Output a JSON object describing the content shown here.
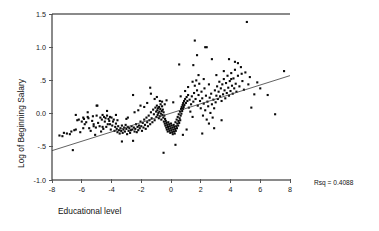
{
  "chart_data": {
    "type": "scatter",
    "title": "",
    "xlabel": "Educational level",
    "ylabel": "Log of Beginning Salary",
    "xlim": [
      -8,
      8
    ],
    "ylim": [
      -1.0,
      1.5
    ],
    "xticks": [
      -8,
      -6,
      -4,
      -2,
      0,
      2,
      4,
      6,
      8
    ],
    "xticklabels": [
      "-8",
      "-6",
      "-4",
      "-2",
      "0",
      "2",
      "4",
      "6",
      "8"
    ],
    "yticks": [
      -1.0,
      -0.5,
      0.0,
      0.5,
      1.0,
      1.5
    ],
    "yticklabels": [
      "-1.0",
      "-.5",
      "0.0",
      ".5",
      "1.0",
      "1.5"
    ],
    "grid": false,
    "legend": null,
    "annotations": [
      {
        "name": "rsq-annotation",
        "text": "Rsq = 0.4088",
        "x": 9.6,
        "y": -0.94
      }
    ],
    "fit_line": {
      "name": "regression-line",
      "x": [
        -8,
        8
      ],
      "y": [
        -0.558,
        0.572
      ],
      "slope": 0.0706,
      "intercept": 0.007
    },
    "marker": {
      "shape": "square",
      "size": 2.1,
      "color": "#0a0a0a"
    },
    "points": [
      [
        -7.5,
        -0.33
      ],
      [
        -7.3,
        -0.34
      ],
      [
        -7.0,
        -0.3
      ],
      [
        -6.8,
        -0.31
      ],
      [
        -6.6,
        -0.55
      ],
      [
        -6.5,
        -0.25
      ],
      [
        -6.4,
        -0.24
      ],
      [
        -6.3,
        -0.1
      ],
      [
        -6.2,
        -0.09
      ],
      [
        -6.1,
        -0.28
      ],
      [
        -6.0,
        -0.12
      ],
      [
        -5.9,
        -0.06
      ],
      [
        -5.85,
        -0.08
      ],
      [
        -5.8,
        -0.16
      ],
      [
        -5.7,
        -0.13
      ],
      [
        -5.6,
        -0.05
      ],
      [
        -5.55,
        -0.07
      ],
      [
        -5.5,
        -0.22
      ],
      [
        -5.4,
        -0.26
      ],
      [
        -5.3,
        -0.11
      ],
      [
        -5.25,
        -0.04
      ],
      [
        -5.2,
        -0.16
      ],
      [
        -5.1,
        -0.32
      ],
      [
        -5.05,
        -0.21
      ],
      [
        -5.0,
        -0.03
      ],
      [
        -4.95,
        0.12
      ],
      [
        -4.9,
        -0.14
      ],
      [
        -4.8,
        -0.19
      ],
      [
        -4.75,
        -0.06
      ],
      [
        -4.7,
        -0.27
      ],
      [
        -4.65,
        -0.09
      ],
      [
        -4.6,
        -0.02
      ],
      [
        -4.55,
        -0.23
      ],
      [
        -4.5,
        -0.05
      ],
      [
        -4.45,
        -0.12
      ],
      [
        -4.4,
        -0.07
      ],
      [
        -4.35,
        -0.2
      ],
      [
        -4.3,
        -0.03
      ],
      [
        -4.25,
        -0.16
      ],
      [
        -4.2,
        -0.08
      ],
      [
        -4.15,
        -0.11
      ],
      [
        -4.1,
        -0.05
      ],
      [
        -4.05,
        -0.24
      ],
      [
        -4.0,
        -0.06
      ],
      [
        -3.95,
        -0.18
      ],
      [
        -3.9,
        -0.12
      ],
      [
        -3.85,
        -0.09
      ],
      [
        -3.8,
        -0.26
      ],
      [
        -3.75,
        -0.2
      ],
      [
        -3.7,
        -0.15
      ],
      [
        -3.65,
        -0.23
      ],
      [
        -3.6,
        -0.28
      ],
      [
        -3.55,
        -0.19
      ],
      [
        -3.5,
        -0.25
      ],
      [
        -3.45,
        -0.3
      ],
      [
        -3.4,
        -0.22
      ],
      [
        -3.35,
        -0.26
      ],
      [
        -3.3,
        -0.18
      ],
      [
        -3.25,
        -0.29
      ],
      [
        -3.2,
        -0.24
      ],
      [
        -3.15,
        -0.21
      ],
      [
        -3.1,
        -0.27
      ],
      [
        -3.05,
        -0.17
      ],
      [
        -3.0,
        -0.23
      ],
      [
        -2.95,
        -0.31
      ],
      [
        -2.9,
        -0.2
      ],
      [
        -2.85,
        -0.26
      ],
      [
        -2.8,
        -0.22
      ],
      [
        -2.75,
        -0.29
      ],
      [
        -2.7,
        -0.25
      ],
      [
        -2.65,
        -0.19
      ],
      [
        -2.6,
        -0.24
      ],
      [
        -2.55,
        -0.41
      ],
      [
        -2.5,
        -0.21
      ],
      [
        -2.45,
        -0.27
      ],
      [
        -2.4,
        -0.23
      ],
      [
        -2.35,
        -0.16
      ],
      [
        -2.3,
        -0.28
      ],
      [
        -2.25,
        -0.2
      ],
      [
        -2.2,
        -0.25
      ],
      [
        -2.15,
        -0.18
      ],
      [
        -2.1,
        -0.22
      ],
      [
        -2.05,
        -0.12
      ],
      [
        -2.0,
        -0.19
      ],
      [
        -1.95,
        -0.26
      ],
      [
        -1.9,
        -0.14
      ],
      [
        -1.85,
        -0.21
      ],
      [
        -1.8,
        -0.09
      ],
      [
        -1.75,
        -0.17
      ],
      [
        -1.7,
        -0.23
      ],
      [
        -1.65,
        -0.06
      ],
      [
        -1.6,
        -0.13
      ],
      [
        -1.55,
        -0.19
      ],
      [
        -1.5,
        -0.03
      ],
      [
        -1.45,
        -0.1
      ],
      [
        -1.4,
        -0.16
      ],
      [
        -1.35,
        0.02
      ],
      [
        -1.3,
        -0.07
      ],
      [
        -1.25,
        -0.13
      ],
      [
        -1.2,
        0.06
      ],
      [
        -1.15,
        -0.01
      ],
      [
        -1.1,
        -0.1
      ],
      [
        -1.05,
        0.09
      ],
      [
        -1.0,
        0.03
      ],
      [
        -0.98,
        -0.05
      ],
      [
        -0.95,
        0.12
      ],
      [
        -0.92,
        0.05
      ],
      [
        -0.9,
        -0.02
      ],
      [
        -0.88,
        0.08
      ],
      [
        -0.85,
        0.01
      ],
      [
        -0.82,
        -0.07
      ],
      [
        -0.8,
        0.1
      ],
      [
        -0.78,
        0.03
      ],
      [
        -0.75,
        -0.04
      ],
      [
        -0.72,
        0.07
      ],
      [
        -0.7,
        0.14
      ],
      [
        -0.68,
        0.0
      ],
      [
        -0.65,
        -0.09
      ],
      [
        -0.62,
        0.04
      ],
      [
        -0.6,
        0.11
      ],
      [
        -0.58,
        -0.02
      ],
      [
        -0.55,
        0.06
      ],
      [
        -0.52,
        -0.06
      ],
      [
        -0.5,
        0.02
      ],
      [
        -0.48,
        -0.12
      ],
      [
        -0.45,
        -0.03
      ],
      [
        -0.42,
        -0.15
      ],
      [
        -0.4,
        -0.08
      ],
      [
        -0.38,
        -0.18
      ],
      [
        -0.35,
        -0.11
      ],
      [
        -0.32,
        -0.21
      ],
      [
        -0.3,
        -0.14
      ],
      [
        -0.28,
        -0.24
      ],
      [
        -0.25,
        -0.17
      ],
      [
        -0.22,
        -0.27
      ],
      [
        -0.2,
        -0.2
      ],
      [
        -0.18,
        -0.13
      ],
      [
        -0.15,
        -0.23
      ],
      [
        -0.12,
        -0.16
      ],
      [
        -0.1,
        -0.26
      ],
      [
        -0.08,
        -0.19
      ],
      [
        -0.05,
        -0.29
      ],
      [
        -0.02,
        -0.22
      ],
      [
        0.0,
        -0.15
      ],
      [
        0.02,
        -0.25
      ],
      [
        0.05,
        -0.18
      ],
      [
        0.08,
        -0.28
      ],
      [
        0.1,
        -0.21
      ],
      [
        0.12,
        -0.31
      ],
      [
        0.15,
        -0.24
      ],
      [
        0.18,
        -0.17
      ],
      [
        0.2,
        -0.27
      ],
      [
        0.22,
        -0.2
      ],
      [
        0.25,
        -0.3
      ],
      [
        0.28,
        -0.23
      ],
      [
        0.3,
        -0.13
      ],
      [
        0.32,
        -0.26
      ],
      [
        0.35,
        -0.19
      ],
      [
        0.38,
        -0.09
      ],
      [
        0.4,
        -0.22
      ],
      [
        0.42,
        -0.15
      ],
      [
        0.45,
        -0.05
      ],
      [
        0.48,
        -0.18
      ],
      [
        0.5,
        -0.11
      ],
      [
        0.52,
        -0.01
      ],
      [
        0.55,
        -0.14
      ],
      [
        0.58,
        -0.07
      ],
      [
        0.6,
        0.03
      ],
      [
        0.62,
        -0.1
      ],
      [
        0.65,
        -0.03
      ],
      [
        0.68,
        0.07
      ],
      [
        0.7,
        0.0
      ],
      [
        0.72,
        0.1
      ],
      [
        0.75,
        0.04
      ],
      [
        0.78,
        0.13
      ],
      [
        0.8,
        0.07
      ],
      [
        0.82,
        0.16
      ],
      [
        0.85,
        0.1
      ],
      [
        0.88,
        0.19
      ],
      [
        0.9,
        0.13
      ],
      [
        0.95,
        0.22
      ],
      [
        1.0,
        0.16
      ],
      [
        1.05,
        0.25
      ],
      [
        1.1,
        0.19
      ],
      [
        1.15,
        0.28
      ],
      [
        1.2,
        0.09
      ],
      [
        1.25,
        0.21
      ],
      [
        1.3,
        0.03
      ],
      [
        1.35,
        0.14
      ],
      [
        1.4,
        0.26
      ],
      [
        1.45,
        -0.05
      ],
      [
        1.5,
        0.18
      ],
      [
        1.55,
        0.31
      ],
      [
        1.6,
        0.42
      ],
      [
        1.65,
        0.22
      ],
      [
        1.7,
        0.5
      ],
      [
        1.75,
        0.35
      ],
      [
        1.8,
        0.12
      ],
      [
        1.85,
        0.28
      ],
      [
        1.9,
        0.45
      ],
      [
        1.95,
        0.19
      ],
      [
        2.0,
        0.08
      ],
      [
        2.05,
        0.33
      ],
      [
        2.1,
        0.23
      ],
      [
        2.15,
        -0.03
      ],
      [
        2.2,
        0.15
      ],
      [
        2.25,
        0.38
      ],
      [
        2.3,
        0.05
      ],
      [
        2.35,
        0.27
      ],
      [
        2.4,
        -0.09
      ],
      [
        2.45,
        0.18
      ],
      [
        2.5,
        0.11
      ],
      [
        2.55,
        -0.15
      ],
      [
        2.6,
        0.24
      ],
      [
        2.65,
        0.01
      ],
      [
        2.7,
        0.3
      ],
      [
        2.75,
        0.14
      ],
      [
        2.8,
        -0.06
      ],
      [
        2.85,
        0.21
      ],
      [
        2.9,
        0.08
      ],
      [
        2.95,
        0.35
      ],
      [
        3.0,
        0.17
      ],
      [
        3.05,
        0.27
      ],
      [
        3.1,
        0.41
      ],
      [
        3.15,
        0.22
      ],
      [
        3.2,
        0.33
      ],
      [
        3.25,
        0.48
      ],
      [
        3.3,
        0.26
      ],
      [
        3.35,
        0.38
      ],
      [
        3.4,
        0.19
      ],
      [
        3.45,
        0.44
      ],
      [
        3.5,
        0.29
      ],
      [
        3.55,
        0.52
      ],
      [
        3.6,
        0.35
      ],
      [
        3.65,
        0.23
      ],
      [
        3.7,
        0.46
      ],
      [
        3.75,
        0.31
      ],
      [
        3.8,
        0.57
      ],
      [
        3.85,
        0.39
      ],
      [
        3.9,
        0.27
      ],
      [
        3.95,
        0.49
      ],
      [
        4.0,
        0.34
      ],
      [
        4.05,
        0.61
      ],
      [
        4.1,
        0.42
      ],
      [
        4.15,
        0.3
      ],
      [
        4.2,
        0.53
      ],
      [
        4.25,
        0.38
      ],
      [
        4.3,
        0.66
      ],
      [
        4.35,
        0.45
      ],
      [
        4.4,
        0.33
      ],
      [
        4.5,
        0.57
      ],
      [
        4.6,
        0.41
      ],
      [
        4.7,
        0.7
      ],
      [
        4.8,
        0.49
      ],
      [
        4.9,
        0.36
      ],
      [
        5.0,
        0.62
      ],
      [
        5.1,
        1.38
      ],
      [
        5.2,
        0.44
      ],
      [
        5.3,
        0.55
      ],
      [
        5.4,
        0.09
      ],
      [
        5.6,
        0.29
      ],
      [
        5.8,
        0.47
      ],
      [
        6.0,
        0.38
      ],
      [
        6.5,
        0.28
      ],
      [
        7.0,
        -0.01
      ],
      [
        7.6,
        0.64
      ],
      [
        1.6,
        1.1
      ],
      [
        1.75,
        0.88
      ],
      [
        2.3,
        1.0
      ],
      [
        2.4,
        1.0
      ],
      [
        1.5,
        0.73
      ],
      [
        2.75,
        0.82
      ],
      [
        3.9,
        0.82
      ],
      [
        4.3,
        0.78
      ],
      [
        4.5,
        0.76
      ],
      [
        0.55,
        0.74
      ],
      [
        -1.4,
        0.39
      ],
      [
        -0.5,
        -0.59
      ],
      [
        -2.55,
        0.28
      ],
      [
        -5.0,
        0.12
      ],
      [
        -3.3,
        -0.42
      ],
      [
        -1.35,
        0.3
      ],
      [
        0.3,
        -0.47
      ],
      [
        -0.95,
        0.25
      ],
      [
        2.1,
        -0.3
      ],
      [
        2.9,
        -0.22
      ],
      [
        3.4,
        -0.1
      ],
      [
        1.05,
        -0.24
      ],
      [
        0.8,
        -0.32
      ],
      [
        -6.4,
        -0.02
      ],
      [
        -0.6,
        0.18
      ],
      [
        -0.3,
        0.2
      ],
      [
        0.15,
        0.17
      ],
      [
        -1.8,
        0.1
      ],
      [
        -2.2,
        0.05
      ],
      [
        -4.3,
        0.04
      ],
      [
        -5.6,
        0.02
      ],
      [
        -3.7,
        -0.02
      ],
      [
        -2.9,
        -0.06
      ],
      [
        4.75,
        0.6
      ],
      [
        3.05,
        0.58
      ],
      [
        3.55,
        0.64
      ],
      [
        4.05,
        0.52
      ],
      [
        2.55,
        0.44
      ],
      [
        2.2,
        0.52
      ],
      [
        1.85,
        0.58
      ],
      [
        1.45,
        0.48
      ],
      [
        1.15,
        0.4
      ],
      [
        0.95,
        0.34
      ],
      [
        0.65,
        0.26
      ],
      [
        -0.42,
        0.14
      ],
      [
        -0.75,
        0.19
      ],
      [
        -1.1,
        0.22
      ],
      [
        -1.6,
        0.16
      ],
      [
        -2.05,
        0.12
      ],
      [
        -2.45,
        0.02
      ],
      [
        -3.0,
        -0.08
      ],
      [
        -3.6,
        -0.1
      ],
      [
        -4.1,
        -0.16
      ],
      [
        -4.6,
        -0.2
      ],
      [
        -5.2,
        -0.19
      ],
      [
        -5.9,
        -0.22
      ],
      [
        -6.7,
        -0.27
      ],
      [
        -7.2,
        -0.29
      ]
    ]
  }
}
